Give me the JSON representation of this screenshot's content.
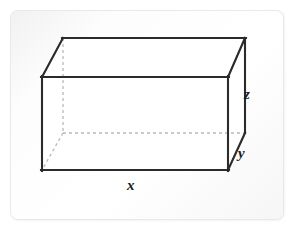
{
  "figure": {
    "shape": "rectangular prism",
    "stroke_color": "#2b2b2b",
    "hidden_edge_color": "#b4b4b4",
    "face_fill": "#ffffff",
    "panel_background": "#fbfbfb",
    "labels": {
      "length": "x",
      "depth": "y",
      "height": "z"
    },
    "vertices": {
      "front_top_left": [
        42,
        77
      ],
      "front_top_right": [
        228,
        77
      ],
      "front_bottom_right": [
        228,
        170
      ],
      "front_bottom_left": [
        42,
        170
      ],
      "back_top_left": [
        63,
        38
      ],
      "back_top_right": [
        245,
        38
      ],
      "back_bottom_left": [
        63,
        133
      ],
      "back_bottom_right": [
        245,
        133
      ]
    },
    "visible_edges": [
      "front-top",
      "front-right",
      "front-bottom",
      "front-left",
      "back-top",
      "top-left-diagonal",
      "top-right-diagonal",
      "right-bottom-diagonal"
    ],
    "hidden_edges": [
      "back-left-vertical",
      "back-bottom-horizontal",
      "bottom-left-diagonal"
    ]
  }
}
